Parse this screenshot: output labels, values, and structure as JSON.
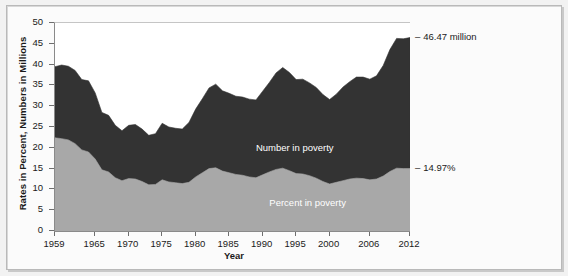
{
  "chart_data": {
    "type": "area",
    "title": "",
    "xlabel": "Year",
    "ylabel": "Rates in Percent, Numbers in Millions",
    "xlim": [
      1959,
      2012
    ],
    "ylim": [
      0,
      50
    ],
    "grid": false,
    "legend_position": "inline",
    "ytick_labels": [
      "0",
      "5",
      "10",
      "15",
      "20",
      "25",
      "30",
      "35",
      "40",
      "45",
      "50"
    ],
    "ytick_values": [
      0,
      5,
      10,
      15,
      20,
      25,
      30,
      35,
      40,
      45,
      50
    ],
    "xtick_labels": [
      "1959",
      "1965",
      "1970",
      "1975",
      "1980",
      "1985",
      "1990",
      "1995",
      "2000",
      "2006",
      "2012"
    ],
    "xtick_values": [
      1959,
      1965,
      1970,
      1975,
      1980,
      1985,
      1990,
      1995,
      2000,
      2006,
      2012
    ],
    "x": [
      1959,
      1960,
      1961,
      1962,
      1963,
      1964,
      1965,
      1966,
      1967,
      1968,
      1969,
      1970,
      1971,
      1972,
      1973,
      1974,
      1975,
      1976,
      1977,
      1978,
      1979,
      1980,
      1981,
      1982,
      1983,
      1984,
      1985,
      1986,
      1987,
      1988,
      1989,
      1990,
      1991,
      1992,
      1993,
      1994,
      1995,
      1996,
      1997,
      1998,
      1999,
      2000,
      2001,
      2002,
      2003,
      2004,
      2005,
      2006,
      2007,
      2008,
      2009,
      2010,
      2011,
      2012
    ],
    "series": [
      {
        "name": "Number in poverty",
        "unit": "millions",
        "color": "#333333",
        "values": [
          39.5,
          39.9,
          39.6,
          38.6,
          36.4,
          36.1,
          33.2,
          28.5,
          27.8,
          25.4,
          24.1,
          25.4,
          25.6,
          24.5,
          23.0,
          23.4,
          25.9,
          25.0,
          24.7,
          24.5,
          26.1,
          29.3,
          31.8,
          34.4,
          35.3,
          33.7,
          33.1,
          32.4,
          32.2,
          31.7,
          31.5,
          33.6,
          35.7,
          38.0,
          39.3,
          38.1,
          36.4,
          36.5,
          35.6,
          34.5,
          32.8,
          31.6,
          32.9,
          34.6,
          35.9,
          37.0,
          37.0,
          36.5,
          37.3,
          39.8,
          43.6,
          46.3,
          46.2,
          46.5
        ]
      },
      {
        "name": "Percent in poverty",
        "unit": "percent",
        "color": "#a8a8a8",
        "values": [
          22.4,
          22.2,
          21.9,
          21.0,
          19.5,
          19.0,
          17.3,
          14.7,
          14.2,
          12.8,
          12.1,
          12.6,
          12.5,
          11.9,
          11.1,
          11.2,
          12.3,
          11.8,
          11.6,
          11.4,
          11.7,
          13.0,
          14.0,
          15.0,
          15.2,
          14.4,
          14.0,
          13.6,
          13.4,
          13.0,
          12.8,
          13.5,
          14.2,
          14.8,
          15.1,
          14.5,
          13.8,
          13.7,
          13.3,
          12.7,
          11.9,
          11.3,
          11.7,
          12.1,
          12.5,
          12.7,
          12.6,
          12.3,
          12.5,
          13.2,
          14.3,
          15.1,
          15.0,
          15.0
        ]
      }
    ],
    "annotations": [
      {
        "text": "46.47 million",
        "dash": "–",
        "series": "Number in poverty",
        "at_x": 2012,
        "at_y": 46.47
      },
      {
        "text": "14.97%",
        "dash": "–",
        "series": "Percent in poverty",
        "at_x": 2012,
        "at_y": 14.97
      }
    ],
    "inline_labels": [
      {
        "text": "Number in poverty"
      },
      {
        "text": "Percent in poverty"
      }
    ]
  }
}
